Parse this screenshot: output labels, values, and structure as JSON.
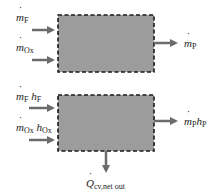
{
  "colors": {
    "box_fill": "#9c9c9c",
    "box_border": "#1a1a1a",
    "arrow": "#6b6b6b",
    "text": "#222222"
  },
  "top_diagram": {
    "inputs": [
      {
        "symbol": "m",
        "sub": "F"
      },
      {
        "symbol": "m",
        "sub": "Ox"
      }
    ],
    "output": {
      "symbol": "m",
      "sub": "P"
    }
  },
  "bottom_diagram": {
    "inputs": [
      {
        "symbol": "m",
        "sub": "F",
        "h": "h",
        "h_sub": "F"
      },
      {
        "symbol": "m",
        "sub": "Ox",
        "h": "h",
        "h_sub": "Ox"
      }
    ],
    "output": {
      "symbol": "m",
      "sub": "P",
      "h": "h",
      "h_sub": "P"
    },
    "heat": {
      "symbol": "Q",
      "sub": "cv,net out"
    }
  }
}
